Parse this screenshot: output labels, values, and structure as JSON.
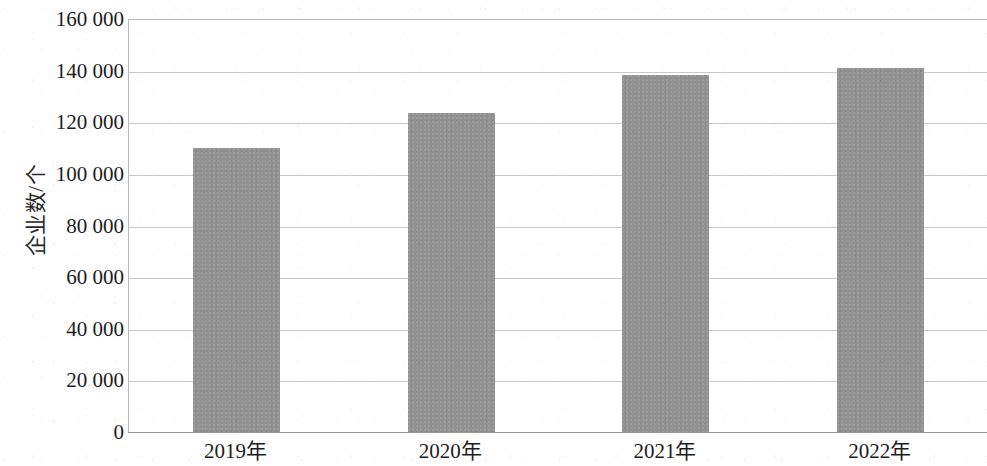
{
  "chart_data": {
    "type": "bar",
    "title": "",
    "xlabel": "",
    "ylabel": "企业数/个",
    "categories": [
      "2019年",
      "2020年",
      "2021年",
      "2022年"
    ],
    "values": [
      110000,
      123500,
      138500,
      141000
    ],
    "ylim": [
      0,
      160000
    ],
    "ytick_step": 20000,
    "ytick_labels": [
      "0",
      "20 000",
      "40 000",
      "60 000",
      "80 000",
      "100 000",
      "120 000",
      "140 000",
      "160 000"
    ],
    "ytick_values": [
      0,
      20000,
      40000,
      60000,
      80000,
      100000,
      120000,
      140000,
      160000
    ],
    "grid": true,
    "grid_axis": "y",
    "legend": null,
    "bar_color": "#919191",
    "gridline_color": "#c8c8c8",
    "axis_color": "#9a9a9a",
    "text_color": "#1d1d1d",
    "background_color": "#ffffff"
  }
}
